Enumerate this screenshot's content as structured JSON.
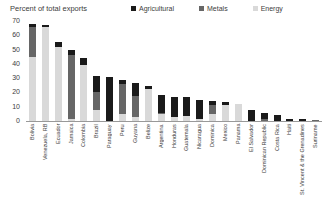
{
  "chart_data": {
    "type": "bar",
    "variant": "stacked-vertical",
    "title": "Percent of total exports",
    "xlabel": "",
    "ylabel": "",
    "ylim": [
      0,
      70
    ],
    "yticks": [
      0,
      10,
      20,
      30,
      40,
      50,
      60,
      70
    ],
    "grid": false,
    "legend_position": "top",
    "stack_order_bottom_to_top": [
      "Energy",
      "Metals",
      "Agricultural"
    ],
    "categories": [
      "Bolivia",
      "Venezuela, RB",
      "Ecuador",
      "Jamaica",
      "Colombia",
      "Brazil",
      "Paraguay",
      "Peru",
      "Guyana",
      "Belize",
      "Argentina",
      "Honduras",
      "Guatemala",
      "Nicaragua",
      "Dominica",
      "Mexico",
      "Panama",
      "El Salvador",
      "Dominican Republic",
      "Costa Rica",
      "Haiti",
      "St. Vincent & the Grenadines",
      "Suriname"
    ],
    "series": [
      {
        "name": "Agricultural",
        "color": "#1a1a1a",
        "values": [
          2,
          1,
          3.5,
          3.5,
          5,
          11,
          31,
          3,
          9,
          2,
          13,
          14.5,
          13,
          13,
          2.5,
          1.5,
          0,
          8,
          4,
          4,
          1.5,
          1.5,
          0
        ]
      },
      {
        "name": "Metals",
        "color": "#666666",
        "values": [
          21,
          0,
          0,
          45,
          0,
          12.5,
          0,
          21,
          15,
          0,
          0.5,
          0,
          0,
          0,
          6.5,
          0,
          0,
          0,
          1.5,
          0,
          0,
          0,
          1
        ]
      },
      {
        "name": "Energy",
        "color": "#d9d9d9",
        "values": [
          45,
          66,
          51.5,
          1.5,
          39,
          8,
          0,
          5,
          2.5,
          22.5,
          5,
          2.5,
          3.5,
          1.5,
          5,
          11.5,
          12,
          0,
          0,
          0,
          0,
          0,
          0
        ]
      }
    ],
    "totals": [
      68,
      67,
      55,
      50,
      44,
      31.5,
      31,
      29,
      26.5,
      24.5,
      18.5,
      17,
      16.5,
      14.5,
      14,
      13,
      12,
      8,
      5.5,
      4,
      1.5,
      1.5,
      1
    ]
  }
}
